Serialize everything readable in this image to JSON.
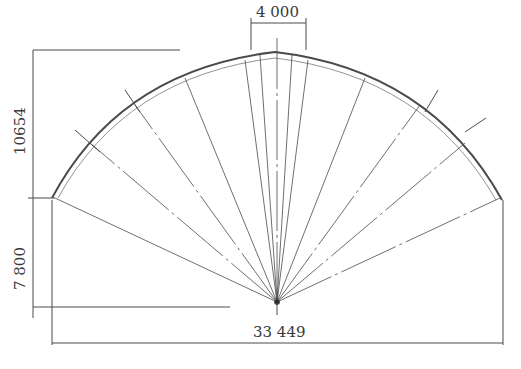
{
  "diagram": {
    "type": "arch-cross-section",
    "dimensions": {
      "top_width": "4 000",
      "left_total_height": "10654",
      "left_lower_height": "7 800",
      "base_span": "33 449"
    },
    "rib_count": 13,
    "caption": ""
  },
  "colors": {
    "line": "#4a4a4a",
    "background": "#ffffff"
  }
}
